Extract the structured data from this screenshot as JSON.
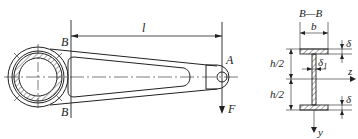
{
  "figure": {
    "labels": {
      "length": "l",
      "section_mark_top": "B",
      "section_mark_bottom": "B",
      "point_a": "A",
      "force": "F",
      "section_title": "B—B",
      "flange_width": "b",
      "flange_thickness_top": "δ",
      "flange_thickness_bottom": "δ",
      "web_thickness": "δ",
      "web_thickness_sub": "1",
      "half_height_top": "h/2",
      "half_height_bottom": "h/2",
      "axis_z": "z",
      "axis_y": "y"
    },
    "colors": {
      "line": "#222222",
      "background": "#ffffff"
    }
  }
}
